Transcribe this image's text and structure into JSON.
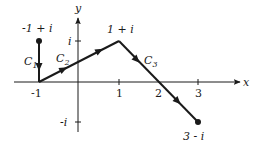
{
  "diagram": {
    "type": "complex-plane-contour",
    "axes": {
      "x_label": "x",
      "y_label": "y",
      "x_ticks": [
        "-1",
        "1",
        "2",
        "3"
      ],
      "y_ticks": [
        "i",
        "-i"
      ]
    },
    "points": [
      {
        "name": "start",
        "label": "-1 + i",
        "x": -1,
        "y": 1
      },
      {
        "name": "corner-a",
        "label": "",
        "x": -1,
        "y": 0
      },
      {
        "name": "corner-b",
        "label": "1 + i",
        "x": 1,
        "y": 1
      },
      {
        "name": "end",
        "label": "3 - i",
        "x": 3,
        "y": -1
      }
    ],
    "segments": [
      {
        "name": "C1",
        "label_main": "C",
        "label_sub": "1",
        "from": "-1 + i",
        "to": "-1"
      },
      {
        "name": "C2",
        "label_main": "C",
        "label_sub": "2",
        "from": "-1",
        "to": "1 + i"
      },
      {
        "name": "C3",
        "label_main": "C",
        "label_sub": "3",
        "from": "1 + i",
        "to": "3 - i"
      }
    ],
    "colors": {
      "ink": "#1a1a1a",
      "background": "#ffffff"
    }
  }
}
